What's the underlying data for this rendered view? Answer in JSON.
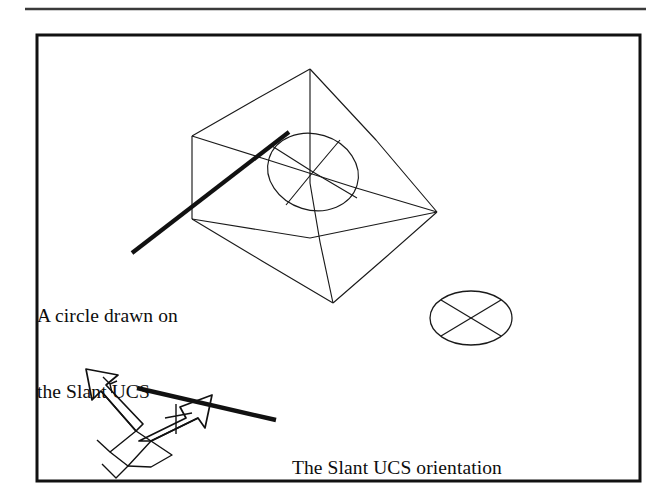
{
  "document": {
    "type": "scanned-technical-figure",
    "background_color": "#ffffff",
    "ink_color": "#111111",
    "page_width": 671,
    "page_height": 500
  },
  "rule": {
    "name": "top-horizontal-rule",
    "color": "#3a3a3a",
    "x1": 25,
    "y1": 9,
    "x2": 646,
    "y2": 9,
    "thickness": 2.6
  },
  "frame": {
    "name": "figure-border",
    "color": "#111111",
    "x": 37,
    "y": 35,
    "width": 603,
    "height": 446,
    "thickness": 3
  },
  "labels": {
    "circle_label": {
      "name": "circle-annotation",
      "lines": [
        "A circle drawn on",
        "the Slant UCS"
      ],
      "x": 37,
      "y": 252,
      "font_size": 19.5
    },
    "ucs_label": {
      "name": "ucs-annotation",
      "lines": [
        "The Slant UCS orientation"
      ],
      "x": 292,
      "y": 404,
      "font_size": 19.5
    }
  },
  "leaders": [
    {
      "name": "leader-to-circle",
      "x1": 132,
      "y1": 253,
      "x2": 289,
      "y2": 132,
      "thickness": 4.2,
      "color": "#111111"
    },
    {
      "name": "leader-to-ucs-icon",
      "x1": 137,
      "y1": 388,
      "x2": 276,
      "y2": 420,
      "thickness": 4.4,
      "color": "#111111"
    }
  ],
  "wedge": {
    "name": "wedge-solid",
    "description": "3D wireframe wedge (ramp) solid with a slanted top face",
    "stroke_color": "#1a1a1a",
    "stroke_width": 1.15,
    "vertices": {
      "apex_top": [
        310,
        69
      ],
      "back_left": [
        192,
        136
      ],
      "back_right": [
        437,
        212
      ],
      "front_left": [
        192,
        218
      ],
      "front_bottom": [
        333,
        303
      ],
      "mid_base_right": [
        437,
        212
      ]
    },
    "edges": [
      {
        "from": [
          310,
          69
        ],
        "to": [
          192,
          136
        ],
        "name": "ridge-to-back-left"
      },
      {
        "from": [
          310,
          69
        ],
        "to": [
          437,
          212
        ],
        "name": "ridge-to-back-right"
      },
      {
        "from": [
          310,
          69
        ],
        "to": [
          310,
          182
        ],
        "name": "vertical-ridge-drop"
      },
      {
        "from": [
          192,
          136
        ],
        "to": [
          192,
          218
        ],
        "name": "left-vertical-edge"
      },
      {
        "from": [
          192,
          136
        ],
        "to": [
          437,
          212
        ],
        "name": "slant-face-upper"
      },
      {
        "from": [
          192,
          218
        ],
        "to": [
          333,
          303
        ],
        "name": "base-front-left"
      },
      {
        "from": [
          333,
          303
        ],
        "to": [
          437,
          212
        ],
        "name": "base-front-right"
      },
      {
        "from": [
          192,
          218
        ],
        "to": [
          437,
          212
        ],
        "name": "interior-diagonal"
      },
      {
        "from": [
          310,
          182
        ],
        "to": [
          333,
          303
        ],
        "name": "interior-vertical-to-front"
      }
    ]
  },
  "slant_circle": {
    "name": "circle-on-slant-ucs",
    "description": "Circle drawn on the slanted face, appears elliptical in projection",
    "center": [
      313,
      172
    ],
    "radius_x": 46,
    "radius_y": 38,
    "rotation_deg": 17,
    "stroke_color": "#1a1a1a",
    "stroke_width": 1.15,
    "crosshair_lines": 2
  },
  "flat_ellipse": {
    "name": "ellipse-on-world-ucs",
    "description": "Ellipse with X crossing diagonals on the world plane",
    "center": [
      471,
      318
    ],
    "radius_x": 41,
    "radius_y": 27,
    "stroke_color": "#1a1a1a",
    "stroke_width": 1.3,
    "diagonals": 2
  },
  "ucs_icon": {
    "name": "ucs-icon",
    "description": "AutoCAD UCS icon showing X and Y broad arrows in the slant orientation",
    "stroke_color": "#111111",
    "stroke_width": 1.6,
    "origin": [
      118,
      426
    ],
    "x_arrow_tip": [
      212,
      395
    ],
    "y_arrow_tip": [
      84,
      372
    ],
    "axis_letters": [
      "Y",
      "X"
    ]
  }
}
